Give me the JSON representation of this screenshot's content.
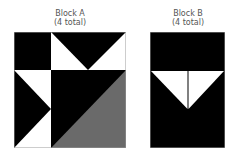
{
  "blocks": [
    {
      "title": "Block A",
      "count": "(4 total)"
    },
    {
      "title": "Block B",
      "count": "(4 total)"
    }
  ],
  "colors": {
    "dark": "#000000",
    "light": "#ffffff",
    "gray": "#6a6a6a",
    "label": "#555555",
    "outline": "#9a9a9a"
  }
}
